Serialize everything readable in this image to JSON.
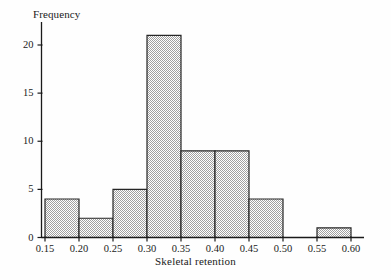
{
  "chart_data": {
    "type": "bar",
    "title": "",
    "subtitle": "",
    "xlabel": "Skeletal retention",
    "ylabel": "Frequency",
    "bin_edges": [
      0.15,
      0.2,
      0.25,
      0.3,
      0.35,
      0.4,
      0.45,
      0.5,
      0.55,
      0.6
    ],
    "categories": [
      "0.15-0.20",
      "0.20-0.25",
      "0.25-0.30",
      "0.30-0.35",
      "0.35-0.40",
      "0.40-0.45",
      "0.45-0.50",
      "0.50-0.55",
      "0.55-0.60"
    ],
    "values": [
      4,
      2,
      5,
      21,
      9,
      9,
      4,
      0,
      1
    ],
    "bin_width": 0.05,
    "xlim": [
      0.15,
      0.61
    ],
    "ylim": [
      0,
      21.8
    ],
    "xticks": [
      0.15,
      0.2,
      0.25,
      0.3,
      0.35,
      0.4,
      0.45,
      0.5,
      0.55,
      0.6
    ],
    "xtick_labels": [
      "0.15",
      "0.20",
      "0.25",
      "0.30",
      "0.35",
      "0.40",
      "0.45",
      "0.50",
      "0.55",
      "0.60"
    ],
    "yticks": [
      0,
      5,
      10,
      15,
      20
    ],
    "ytick_labels": [
      "0",
      "5",
      "10",
      "15",
      "20"
    ],
    "grid": false,
    "legend": null,
    "bar_fill_color": "#c9c9c9",
    "bar_edge_color": "#262626",
    "axis_color": "#1a1a1a",
    "background_color": "#fefefe"
  },
  "axis_titles": {
    "y": "Frequency",
    "x": "Skeletal retention"
  }
}
